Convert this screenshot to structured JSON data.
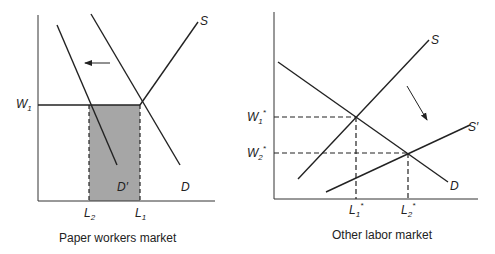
{
  "left_panel": {
    "caption": "Paper workers market",
    "y_label": {
      "main": "W",
      "sub": "1"
    },
    "x_labels": [
      {
        "main": "L",
        "sub": "2"
      },
      {
        "main": "L",
        "sub": "1"
      }
    ],
    "curves": {
      "supply": "S",
      "demand": "D",
      "new_demand": "D′"
    },
    "shaded_area_color": "#a6a6a6",
    "shift_arrow": "left"
  },
  "right_panel": {
    "caption": "Other labor market",
    "y_labels": [
      {
        "main": "W",
        "sub": "1",
        "sup": "*"
      },
      {
        "main": "W",
        "sub": "2",
        "sup": "*"
      }
    ],
    "x_labels": [
      {
        "main": "L",
        "sub": "1",
        "sup": "*"
      },
      {
        "main": "L",
        "sub": "2",
        "sup": "*"
      }
    ],
    "curves": {
      "supply": "S",
      "new_supply": "S′",
      "demand": "D"
    },
    "shift_arrow": "down-right"
  }
}
